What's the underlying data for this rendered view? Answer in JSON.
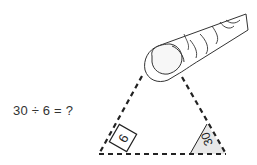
{
  "problem": {
    "equation": "30 ÷ 6 = ?"
  },
  "triangle": {
    "type": "fact-family-triangle",
    "top_vertex": "covered-by-finger",
    "bottom_left_label": "6",
    "bottom_right_label": "30",
    "line_color": "#222222",
    "shade_color": "#e6e6e6"
  },
  "finger": {
    "icon": "pointing-finger-icon"
  }
}
